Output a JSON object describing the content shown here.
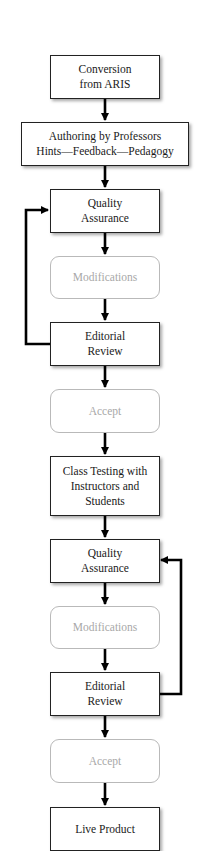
{
  "diagram": {
    "type": "flowchart",
    "direction": "top-to-bottom",
    "colors": {
      "box_border": "#222222",
      "soft_box_border": "#b9b9b9",
      "soft_text": "#a8a8a8",
      "text": "#1a1a1a",
      "arrow": "#000000"
    },
    "nodes": [
      {
        "id": "conversion",
        "style": "solid",
        "lines": [
          "Conversion",
          "from ARIS"
        ]
      },
      {
        "id": "authoring",
        "style": "solid",
        "lines": [
          "Authoring by Professors",
          "Hints—Feedback—Pedagogy"
        ]
      },
      {
        "id": "qa1",
        "style": "solid",
        "lines": [
          "Quality",
          "Assurance"
        ]
      },
      {
        "id": "mod1",
        "style": "soft",
        "lines": [
          "Modifications"
        ]
      },
      {
        "id": "review1",
        "style": "solid",
        "lines": [
          "Editorial",
          "Review"
        ]
      },
      {
        "id": "accept1",
        "style": "soft",
        "lines": [
          "Accept"
        ]
      },
      {
        "id": "classtest",
        "style": "solid",
        "lines": [
          "Class Testing with",
          "Instructors and",
          "Students"
        ]
      },
      {
        "id": "qa2",
        "style": "solid",
        "lines": [
          "Quality",
          "Assurance"
        ]
      },
      {
        "id": "mod2",
        "style": "soft",
        "lines": [
          "Modifications"
        ]
      },
      {
        "id": "review2",
        "style": "solid",
        "lines": [
          "Editorial",
          "Review"
        ]
      },
      {
        "id": "accept2",
        "style": "soft",
        "lines": [
          "Accept"
        ]
      },
      {
        "id": "live",
        "style": "solid",
        "lines": [
          "Live Product"
        ]
      }
    ],
    "edges": [
      {
        "from": "conversion",
        "to": "authoring"
      },
      {
        "from": "authoring",
        "to": "qa1"
      },
      {
        "from": "qa1",
        "to": "mod1"
      },
      {
        "from": "mod1",
        "to": "review1"
      },
      {
        "from": "review1",
        "to": "accept1"
      },
      {
        "from": "review1",
        "to": "qa1",
        "type": "loop-left"
      },
      {
        "from": "accept1",
        "to": "classtest"
      },
      {
        "from": "classtest",
        "to": "qa2"
      },
      {
        "from": "qa2",
        "to": "mod2"
      },
      {
        "from": "mod2",
        "to": "review2"
      },
      {
        "from": "review2",
        "to": "accept2"
      },
      {
        "from": "review2",
        "to": "qa2",
        "type": "loop-right"
      },
      {
        "from": "accept2",
        "to": "live"
      }
    ]
  }
}
